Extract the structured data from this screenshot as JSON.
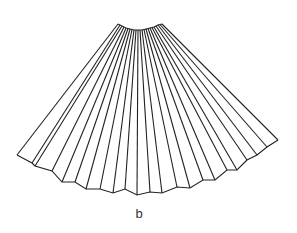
{
  "figure": {
    "label": "b",
    "stroke_color": "#222222",
    "background": "#ffffff"
  },
  "geometry": {
    "top_arc": [
      [
        118,
        24
      ],
      [
        122,
        26
      ],
      [
        126,
        28
      ],
      [
        130,
        29
      ],
      [
        134,
        30
      ],
      [
        138,
        30
      ],
      [
        142,
        30
      ],
      [
        146,
        29
      ],
      [
        150,
        28
      ],
      [
        154,
        27
      ],
      [
        158,
        25
      ],
      [
        162,
        24
      ]
    ],
    "bottom_zigzag": [
      [
        17,
        155
      ],
      [
        32,
        163
      ],
      [
        35,
        166
      ],
      [
        52,
        171
      ],
      [
        62,
        182
      ],
      [
        75,
        182
      ],
      [
        86,
        189
      ],
      [
        100,
        189
      ],
      [
        113,
        193
      ],
      [
        125,
        189
      ],
      [
        137,
        195
      ],
      [
        150,
        192
      ],
      [
        162,
        193
      ],
      [
        177,
        187
      ],
      [
        190,
        188
      ],
      [
        203,
        180
      ],
      [
        215,
        180
      ],
      [
        227,
        170
      ],
      [
        237,
        170
      ],
      [
        247,
        160
      ],
      [
        257,
        155
      ],
      [
        267,
        147
      ],
      [
        278,
        140
      ]
    ]
  }
}
